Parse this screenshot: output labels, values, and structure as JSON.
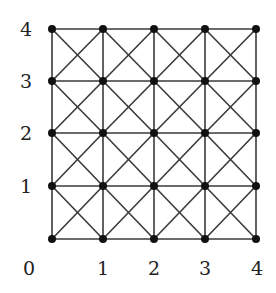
{
  "diagram": {
    "type": "grid-graph",
    "grid_size": 5,
    "x_labels": [
      "0",
      "1",
      "2",
      "3",
      "4"
    ],
    "y_labels": [
      "1",
      "2",
      "3",
      "4"
    ],
    "x_coords_px": [
      52,
      103,
      154,
      205,
      256
    ],
    "y_coords_px": [
      239,
      186,
      133,
      81,
      29
    ],
    "x_label_px": [
      29,
      103,
      154,
      205,
      257
    ],
    "x_label_y_px": 275,
    "y_label_x_px": 26,
    "colors": {
      "edge": "#3a3a3a",
      "node": "#111111",
      "label": "#222222",
      "background": "#ffffff"
    }
  }
}
